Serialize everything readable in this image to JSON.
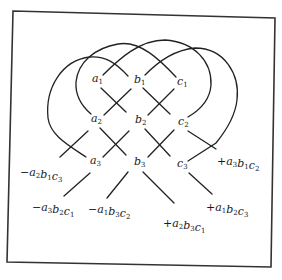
{
  "diagram": {
    "type": "determinant-expansion-mnemonic",
    "frame": {
      "stroke": "#333333"
    },
    "line_color": "#222222",
    "elements": [
      {
        "id": "a1",
        "base": "a",
        "sub": "1",
        "x": 92,
        "y": 82
      },
      {
        "id": "b1",
        "base": "b",
        "sub": "1",
        "x": 134,
        "y": 83
      },
      {
        "id": "c1",
        "base": "c",
        "sub": "1",
        "x": 177,
        "y": 85
      },
      {
        "id": "a2",
        "base": "a",
        "sub": "2",
        "x": 91,
        "y": 122
      },
      {
        "id": "b2",
        "base": "b",
        "sub": "2",
        "x": 135,
        "y": 123
      },
      {
        "id": "c2",
        "base": "c",
        "sub": "2",
        "x": 178,
        "y": 125
      },
      {
        "id": "a3",
        "base": "a",
        "sub": "3",
        "x": 90,
        "y": 164
      },
      {
        "id": "b3",
        "base": "b",
        "sub": "3",
        "x": 134,
        "y": 165
      },
      {
        "id": "c3",
        "base": "c",
        "sub": "3",
        "x": 177,
        "y": 167
      }
    ],
    "products": [
      {
        "id": "p-a2b1c3",
        "sign": "−",
        "terms": [
          [
            "a",
            "2"
          ],
          [
            "b",
            "1"
          ],
          [
            "c",
            "3"
          ]
        ],
        "x": 20,
        "y": 176
      },
      {
        "id": "p-a3b2c1",
        "sign": "−",
        "terms": [
          [
            "a",
            "3"
          ],
          [
            "b",
            "2"
          ],
          [
            "c",
            "1"
          ]
        ],
        "x": 32,
        "y": 211
      },
      {
        "id": "p-a1b3c2",
        "sign": "−",
        "terms": [
          [
            "a",
            "1"
          ],
          [
            "b",
            "3"
          ],
          [
            "c",
            "2"
          ]
        ],
        "x": 88,
        "y": 213
      },
      {
        "id": "p-a2b3c1",
        "sign": "+",
        "terms": [
          [
            "a",
            "2"
          ],
          [
            "b",
            "3"
          ],
          [
            "c",
            "1"
          ]
        ],
        "x": 163,
        "y": 227
      },
      {
        "id": "p-a1b2c3",
        "sign": "+",
        "terms": [
          [
            "a",
            "1"
          ],
          [
            "b",
            "2"
          ],
          [
            "c",
            "3"
          ]
        ],
        "x": 206,
        "y": 211
      },
      {
        "id": "p-a3b1c2",
        "sign": "+",
        "terms": [
          [
            "a",
            "3"
          ],
          [
            "b",
            "1"
          ],
          [
            "c",
            "2"
          ]
        ],
        "x": 217,
        "y": 165
      }
    ]
  }
}
